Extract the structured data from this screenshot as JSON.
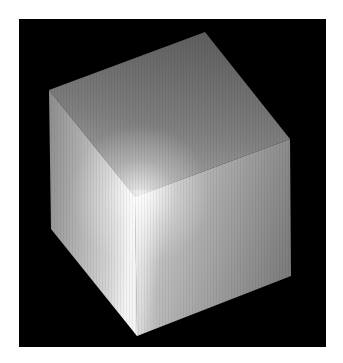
{
  "scene": {
    "subject": "shaded cube",
    "description": "3D rendered gray cube with specular highlight on a black background",
    "colors": {
      "page_background": "#ffffff",
      "render_background": "#000000",
      "top_face_dark": "#5e5e5e",
      "top_face_light": "#a8a8a8",
      "left_face_dark": "#8c8c8c",
      "left_face_light": "#d4d4d4",
      "right_face_dark": "#7c7c7c",
      "right_face_light": "#bdbdbd",
      "highlight": "#f2f2f2"
    }
  }
}
